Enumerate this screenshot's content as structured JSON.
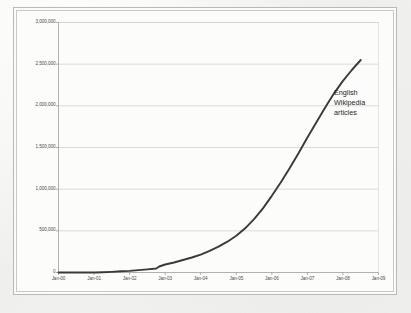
{
  "chart_data": {
    "type": "line",
    "title": "",
    "subtitle": "",
    "xlabel": "",
    "ylabel": "",
    "grid": true,
    "grid_axis": "y",
    "legend": false,
    "annotations": [
      {
        "name": "series-label",
        "lines": [
          "English",
          "Wikipedia",
          "articles"
        ],
        "x_value": "Jan-08",
        "y_value": 2150000
      }
    ],
    "xlim": [
      "Jan-00",
      "Jan-09"
    ],
    "ylim": [
      0,
      3000000
    ],
    "ytick_step": 500000,
    "ytick_labels": [
      "3,000,000",
      "2,500,000",
      "2,000,000",
      "1,500,000",
      "1,000,000",
      "500,000",
      "0"
    ],
    "ytick_values": [
      3000000,
      2500000,
      2000000,
      1500000,
      1000000,
      500000,
      0
    ],
    "xtick_labels": [
      "Jan-00",
      "Jan-01",
      "Jan-02",
      "Jan-03",
      "Jan-04",
      "Jan-05",
      "Jan-06",
      "Jan-07",
      "Jan-08",
      "Jan-09"
    ],
    "series": [
      {
        "name": "English Wikipedia articles",
        "color": "#3a3a3a",
        "x": [
          "Jan-00",
          "Jan-01",
          "Apr-01",
          "Jul-01",
          "Oct-01",
          "Jan-02",
          "Apr-02",
          "Jul-02",
          "Oct-02",
          "Nov-02",
          "Jan-03",
          "Apr-03",
          "Jul-03",
          "Oct-03",
          "Jan-04",
          "Apr-04",
          "Jul-04",
          "Oct-04",
          "Jan-05",
          "Apr-05",
          "Jul-05",
          "Oct-05",
          "Jan-06",
          "Apr-06",
          "Jul-06",
          "Oct-06",
          "Jan-07",
          "Apr-07",
          "Jul-07",
          "Oct-07",
          "Jan-08",
          "Apr-08",
          "Jul-08"
        ],
        "values": [
          0,
          0,
          3000,
          8000,
          15000,
          20000,
          28000,
          38000,
          48000,
          72000,
          96000,
          120000,
          150000,
          180000,
          215000,
          260000,
          310000,
          370000,
          440000,
          530000,
          640000,
          770000,
          920000,
          1080000,
          1250000,
          1430000,
          1620000,
          1800000,
          1980000,
          2150000,
          2300000,
          2430000,
          2550000
        ]
      }
    ]
  }
}
